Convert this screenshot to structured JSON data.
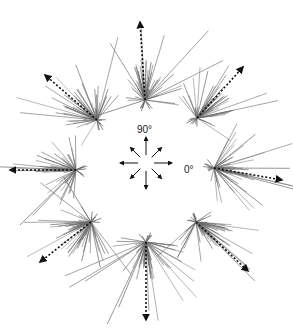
{
  "figure": {
    "type": "radial-trajectory-diagram",
    "labels": {
      "angle_90": "90°",
      "angle_0": "0°"
    },
    "compass": {
      "center": [
        146,
        163
      ],
      "arrow_directions_deg": [
        0,
        45,
        90,
        135,
        180,
        225,
        270,
        315
      ]
    },
    "line_color": "#6a6a6a",
    "mean_arrow_color": "#111111",
    "bursts": [
      {
        "direction_deg": 90,
        "origin": [
          145,
          100
        ],
        "mean_tip": [
          140,
          22
        ]
      },
      {
        "direction_deg": 45,
        "origin": [
          197,
          118
        ],
        "mean_tip": [
          243,
          67
        ]
      },
      {
        "direction_deg": 135,
        "origin": [
          97,
          120
        ],
        "mean_tip": [
          45,
          75
        ]
      },
      {
        "direction_deg": 180,
        "origin": [
          76,
          170
        ],
        "mean_tip": [
          10,
          170
        ]
      },
      {
        "direction_deg": 0,
        "origin": [
          214,
          168
        ],
        "mean_tip": [
          282,
          180
        ]
      },
      {
        "direction_deg": 225,
        "origin": [
          91,
          222
        ],
        "mean_tip": [
          40,
          262
        ]
      },
      {
        "direction_deg": 270,
        "origin": [
          146,
          242
        ],
        "mean_tip": [
          146,
          320
        ]
      },
      {
        "direction_deg": 315,
        "origin": [
          196,
          222
        ],
        "mean_tip": [
          248,
          271
        ]
      }
    ]
  }
}
